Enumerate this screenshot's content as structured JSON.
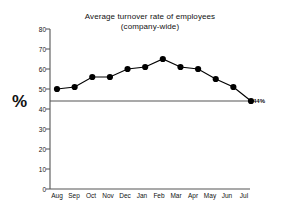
{
  "chart_data": {
    "type": "line",
    "title": "Average turnover rate of employees",
    "subtitle": "(company-wide)",
    "xlabel": "",
    "ylabel": "%",
    "categories": [
      "Aug",
      "Sep",
      "Oct",
      "Nov",
      "Dec",
      "Jan",
      "Feb",
      "Mar",
      "Apr",
      "May",
      "Jun",
      "Jul"
    ],
    "values": [
      50,
      51,
      56,
      56,
      60,
      61,
      65,
      61,
      60,
      55,
      51,
      44
    ],
    "series": [
      {
        "name": "Average turnover rate",
        "values": [
          50,
          51,
          56,
          56,
          60,
          61,
          65,
          61,
          60,
          55,
          51,
          44
        ]
      }
    ],
    "ylim": [
      0,
      80
    ],
    "yticks": [
      0,
      10,
      20,
      30,
      40,
      50,
      60,
      70,
      80
    ],
    "ytick_labels": [
      "0",
      "10",
      "20",
      "30",
      "40",
      "50",
      "60",
      "70",
      "80"
    ],
    "grid": false,
    "legend": false,
    "marker": "filled-circle",
    "line_color": "#000000",
    "marker_color": "#000000",
    "reference_line": {
      "value": 44,
      "label": "44%",
      "color": "#555555"
    },
    "annotations": [
      {
        "text": "44%",
        "x_category": "Jul",
        "y_value": 44
      }
    ]
  },
  "figure": {
    "background_color": "#ffffff",
    "axis_color": "#555555"
  }
}
